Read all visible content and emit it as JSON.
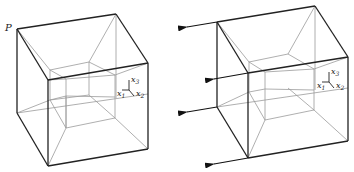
{
  "figure": {
    "left_panel": {
      "vertex_label": "P",
      "axes": {
        "x1": "x",
        "x1_sub": "1",
        "x2": "x",
        "x2_sub": "2",
        "x3": "x",
        "x3_sub": "3"
      }
    },
    "right_panel": {
      "axes": {
        "x1": "x",
        "x1_sub": "1",
        "x2": "x",
        "x2_sub": "2",
        "x3": "x",
        "x3_sub": "3"
      },
      "arrow_count": 4
    }
  },
  "colors": {
    "outer_edge": "#222222",
    "inner_edge": "#9a9a9a",
    "arrow": "#111111"
  }
}
